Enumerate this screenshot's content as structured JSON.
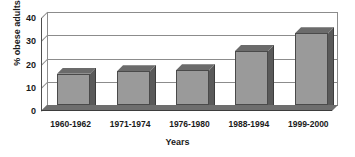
{
  "chart_data": {
    "type": "bar",
    "title": "",
    "xlabel": "Years",
    "ylabel": "% obese adults",
    "categories": [
      "1960-1962",
      "1971-1974",
      "1976-1980",
      "1988-1994",
      "1999-2000"
    ],
    "values": [
      13.4,
      14.5,
      15.0,
      23.2,
      30.9
    ],
    "series": [
      {
        "name": "% obese adults",
        "values": [
          13.4,
          14.5,
          15.0,
          23.2,
          30.9
        ]
      }
    ],
    "ylim": [
      0,
      40
    ],
    "yticks": [
      0,
      10,
      20,
      30,
      40
    ],
    "ytick_labels": [
      "0",
      "10",
      "20",
      "30",
      "40"
    ],
    "grid": true,
    "legend": false,
    "legend_position": "none",
    "style": "3d-column",
    "colors": {
      "bar_front": "#9a9a9a",
      "bar_side": "#5a5a5a",
      "bar_top": "#6b6b6b",
      "bar_outline": "#4a4a4a",
      "gridline": "#8c8c8c",
      "floor": "#6e6e6e",
      "text": "#1a1a1a",
      "background": "#ffffff"
    }
  },
  "axes": {
    "y_title": "% obese adults",
    "x_title": "Years",
    "y_ticks": [
      {
        "label": "40",
        "value": 40
      },
      {
        "label": "30",
        "value": 30
      },
      {
        "label": "20",
        "value": 20
      },
      {
        "label": "10",
        "value": 10
      },
      {
        "label": "0",
        "value": 0
      }
    ],
    "x_ticks": [
      {
        "label": "1960-1962"
      },
      {
        "label": "1971-1974"
      },
      {
        "label": "1976-1980"
      },
      {
        "label": "1988-1994"
      },
      {
        "label": "1999-2000"
      }
    ]
  }
}
